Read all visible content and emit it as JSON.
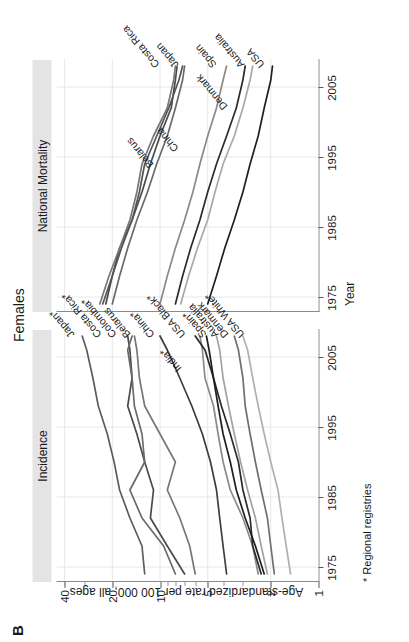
{
  "figure": {
    "panel_letter": "B",
    "title": "Females",
    "footnote": "* Regional registries"
  },
  "panels": [
    {
      "id": "incidence",
      "header": "Incidence"
    },
    {
      "id": "mortality",
      "header": "National Mortality"
    }
  ],
  "axes": {
    "y_title": "Age-standardized rate per 100 000, all ages",
    "y_ticks": [
      "1",
      "2",
      "5",
      "10",
      "20",
      "40"
    ],
    "y_tick_values": [
      1,
      2,
      5,
      10,
      20,
      40
    ],
    "y_scale": "log",
    "x_title": "Year",
    "x_ticks": [
      "1975",
      "1985",
      "1995",
      "2005"
    ],
    "x_tick_values": [
      1975,
      1985,
      1995,
      2005
    ]
  },
  "colors": {
    "dark": "#2b2b2b",
    "mid": "#5d5d5d",
    "light": "#9a9a9a",
    "grid": "#e8e8e8",
    "strip": "#e4e4e4",
    "axis": "#7d7d7d"
  },
  "chart_data": {
    "type": "line",
    "title": "Females",
    "subtitle": "Age-standardized thyroid/cancer rate trends, incidence and national mortality",
    "xlabel": "Year",
    "ylabel": "Age-standardized rate per 100 000, all ages",
    "yscale": "log",
    "ylim": [
      1,
      45
    ],
    "xlim": [
      1973,
      2009
    ],
    "grid": true,
    "legend": "inline-series-labels",
    "panels": [
      {
        "name": "Incidence",
        "series": [
          {
            "name": "Japan*",
            "color": "#5d5d5d",
            "x": [
              1974,
              1978,
              1982,
              1986,
              1990,
              1994,
              1998,
              2002,
              2006,
              2008
            ],
            "y": [
              12.5,
              13.0,
              15.5,
              18.0,
              19.5,
              21.5,
              24.5,
              26.5,
              29.0,
              31.0
            ]
          },
          {
            "name": "Costa Rica*",
            "color": "#4a4a4a",
            "x": [
              1974,
              1978,
              1982,
              1986,
              1990,
              1994,
              1998,
              2002,
              2006,
              2008
            ],
            "y": [
              7.0,
              9.0,
              11.5,
              11.0,
              12.5,
              14.0,
              16.0,
              15.0,
              15.5,
              16.0
            ]
          },
          {
            "name": "Colombia*",
            "color": "#6a6a6a",
            "x": [
              1974,
              1978,
              1982,
              1986,
              1990,
              1994,
              1998,
              2002,
              2006,
              2008
            ],
            "y": [
              8.0,
              9.5,
              13.0,
              15.5,
              12.5,
              13.0,
              14.5,
              15.0,
              16.0,
              15.0
            ]
          },
          {
            "name": "Belarus",
            "color": "#777777",
            "x": [
              1974,
              1978,
              1982,
              1986,
              1990,
              1994,
              1998,
              2002,
              2006,
              2008
            ],
            "y": [
              6.0,
              6.5,
              7.5,
              9.0,
              8.0,
              10.0,
              12.5,
              13.5,
              14.0,
              14.5
            ]
          },
          {
            "name": "China*",
            "color": "#3d3d3d",
            "x": [
              1974,
              1978,
              1982,
              1986,
              1990,
              1994,
              1998,
              2002,
              2006,
              2008
            ],
            "y": [
              3.8,
              4.0,
              4.2,
              4.4,
              4.8,
              5.4,
              6.3,
              7.5,
              9.0,
              10.0
            ]
          },
          {
            "name": "India*",
            "color": "#8a8a8a",
            "x": [
              1974,
              1978,
              1982,
              1986,
              1990,
              1994,
              1998,
              2002,
              2006,
              2008
            ],
            "y": [
              2.4,
              2.6,
              3.0,
              3.6,
              4.0,
              4.3,
              4.6,
              5.2,
              5.4,
              5.6
            ]
          },
          {
            "name": "USA Black*",
            "color": "#2b2b2b",
            "x": [
              1974,
              1978,
              1982,
              1986,
              1990,
              1994,
              1998,
              2002,
              2006,
              2008
            ],
            "y": [
              2.3,
              2.6,
              2.7,
              3.0,
              3.2,
              3.6,
              4.1,
              4.6,
              5.2,
              6.0
            ]
          },
          {
            "name": "Spain*",
            "color": "#1f1f1f",
            "x": [
              1974,
              1978,
              1982,
              1986,
              1990,
              1994,
              1998,
              2002,
              2006,
              2008
            ],
            "y": [
              2.2,
              2.5,
              2.9,
              3.3,
              3.6,
              4.0,
              4.3,
              4.6,
              4.9,
              5.1
            ]
          },
          {
            "name": "Australia",
            "color": "#a3a3a3",
            "x": [
              1974,
              1978,
              1982,
              1986,
              1990,
              1994,
              1998,
              2002,
              2006,
              2008
            ],
            "y": [
              2.1,
              2.3,
              2.5,
              2.8,
              3.1,
              3.4,
              3.7,
              4.0,
              4.2,
              4.4
            ]
          },
          {
            "name": "Denmark",
            "color": "#6f6f6f",
            "x": [
              1974,
              1978,
              1982,
              1986,
              1990,
              1994,
              1998,
              2002,
              2006,
              2008
            ],
            "y": [
              1.9,
              2.0,
              2.1,
              2.3,
              2.5,
              2.7,
              2.9,
              3.0,
              3.2,
              3.4
            ]
          },
          {
            "name": "USA White*",
            "color": "#b0b0b0",
            "x": [
              1974,
              1978,
              1982,
              1986,
              1990,
              1994,
              1998,
              2002,
              2006,
              2008
            ],
            "y": [
              1.5,
              1.6,
              1.7,
              1.8,
              2.0,
              2.2,
              2.4,
              2.6,
              2.8,
              3.0
            ]
          }
        ]
      },
      {
        "name": "National Mortality",
        "series": [
          {
            "name": "Costa Rica",
            "color": "#4a4a4a",
            "x": [
              1974,
              1978,
              1982,
              1986,
              1990,
              1994,
              1998,
              2002,
              2006,
              2008
            ],
            "y": [
              22.0,
              20.0,
              18.0,
              15.0,
              13.0,
              11.5,
              10.0,
              8.5,
              8.0,
              7.8
            ]
          },
          {
            "name": "Japan",
            "color": "#6a6a6a",
            "x": [
              1974,
              1978,
              1982,
              1986,
              1990,
              1994,
              1998,
              2002,
              2006,
              2008
            ],
            "y": [
              20.0,
              18.0,
              16.0,
              14.0,
              12.0,
              10.5,
              9.0,
              8.0,
              7.2,
              7.0
            ]
          },
          {
            "name": "Belarus",
            "color": "#777777",
            "x": [
              1974,
              1978,
              1982,
              1986,
              1990,
              1994,
              1998,
              2002,
              2006,
              2008
            ],
            "y": [
              24.0,
              21.0,
              18.0,
              15.5,
              14.0,
              13.0,
              11.0,
              9.0,
              8.2,
              8.0
            ]
          },
          {
            "name": "China",
            "color": "#555555",
            "x": [
              1974,
              1978,
              1982,
              1986,
              1990,
              1994,
              1998,
              2002,
              2006,
              2008
            ],
            "y": [
              23.0,
              20.0,
              17.5,
              15.0,
              13.5,
              12.5,
              10.5,
              8.8,
              7.6,
              7.2
            ]
          },
          {
            "name": "Spain",
            "color": "#8a8a8a",
            "x": [
              1974,
              1978,
              1982,
              1986,
              1990,
              1994,
              1998,
              2002,
              2006,
              2008
            ],
            "y": [
              10.0,
              9.0,
              8.0,
              7.0,
              6.2,
              5.6,
              5.0,
              4.4,
              4.0,
              3.8
            ]
          },
          {
            "name": "Denmark",
            "color": "#2b2b2b",
            "x": [
              1974,
              1978,
              1982,
              1986,
              1990,
              1994,
              1998,
              2002,
              2006,
              2008
            ],
            "y": [
              8.0,
              7.2,
              6.4,
              5.6,
              5.0,
              4.4,
              3.8,
              3.3,
              3.0,
              2.9
            ]
          },
          {
            "name": "Australia",
            "color": "#a8a8a8",
            "x": [
              1974,
              1978,
              1982,
              1986,
              1990,
              1994,
              1998,
              2002,
              2006,
              2008
            ],
            "y": [
              7.4,
              6.6,
              5.8,
              5.0,
              4.5,
              4.0,
              3.4,
              3.0,
              2.7,
              2.6
            ]
          },
          {
            "name": "USA",
            "color": "#1f1f1f",
            "x": [
              1974,
              1978,
              1982,
              1986,
              1990,
              1994,
              1998,
              2002,
              2006,
              2008
            ],
            "y": [
              5.0,
              4.4,
              3.9,
              3.4,
              3.0,
              2.7,
              2.4,
              2.2,
              2.0,
              1.95
            ]
          }
        ]
      }
    ]
  }
}
